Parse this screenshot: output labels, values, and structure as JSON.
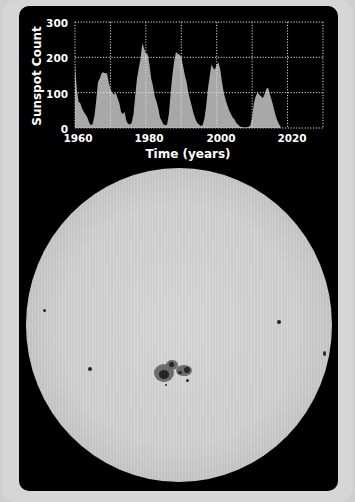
{
  "chart_data": {
    "type": "area",
    "title": "",
    "xlabel": "Time (years)",
    "ylabel": "Sunspot Count",
    "xlim": [
      1960,
      2030
    ],
    "ylim": [
      0,
      300
    ],
    "xticks": [
      1960,
      1980,
      2000,
      2020
    ],
    "yticks": [
      0,
      100,
      200,
      300
    ],
    "grid": true,
    "grid_style": "dotted",
    "series": [
      {
        "name": "Sunspot Count",
        "color": "#a8a8a8",
        "x": [
          1960.0,
          1960.5,
          1961.0,
          1961.5,
          1962.0,
          1962.5,
          1963.0,
          1963.5,
          1964.0,
          1964.5,
          1965.0,
          1965.5,
          1966.0,
          1966.5,
          1967.0,
          1967.5,
          1968.0,
          1968.5,
          1969.0,
          1969.5,
          1970.0,
          1970.5,
          1971.0,
          1971.5,
          1972.0,
          1972.5,
          1973.0,
          1973.5,
          1974.0,
          1974.5,
          1975.0,
          1975.5,
          1976.0,
          1976.5,
          1977.0,
          1977.5,
          1978.0,
          1978.5,
          1979.0,
          1979.5,
          1980.0,
          1980.5,
          1981.0,
          1981.5,
          1982.0,
          1982.5,
          1983.0,
          1983.5,
          1984.0,
          1984.5,
          1985.0,
          1985.5,
          1986.0,
          1986.5,
          1987.0,
          1987.5,
          1988.0,
          1988.5,
          1989.0,
          1989.5,
          1990.0,
          1990.5,
          1991.0,
          1991.5,
          1992.0,
          1992.5,
          1993.0,
          1993.5,
          1994.0,
          1994.5,
          1995.0,
          1995.5,
          1996.0,
          1996.5,
          1997.0,
          1997.5,
          1998.0,
          1998.5,
          1999.0,
          1999.5,
          2000.0,
          2000.5,
          2001.0,
          2001.5,
          2002.0,
          2002.5,
          2003.0,
          2003.5,
          2004.0,
          2004.5,
          2005.0,
          2005.5,
          2006.0,
          2006.5,
          2007.0,
          2007.5,
          2008.0,
          2008.5,
          2009.0,
          2009.5,
          2010.0,
          2010.5,
          2011.0,
          2011.5,
          2012.0,
          2012.5,
          2013.0,
          2013.5,
          2014.0,
          2014.5,
          2015.0,
          2015.5,
          2016.0,
          2016.5,
          2017.0,
          2017.5,
          2018.0
        ],
        "values": [
          180,
          110,
          75,
          70,
          55,
          45,
          38,
          30,
          15,
          8,
          12,
          35,
          80,
          130,
          140,
          155,
          158,
          155,
          155,
          130,
          110,
          100,
          95,
          100,
          85,
          70,
          45,
          40,
          45,
          20,
          12,
          10,
          15,
          40,
          90,
          140,
          170,
          195,
          240,
          225,
          210,
          210,
          180,
          140,
          120,
          90,
          75,
          55,
          30,
          20,
          10,
          8,
          10,
          40,
          100,
          150,
          190,
          215,
          210,
          208,
          200,
          175,
          150,
          130,
          100,
          80,
          60,
          40,
          25,
          15,
          10,
          6,
          8,
          25,
          60,
          110,
          145,
          180,
          170,
          165,
          180,
          185,
          165,
          130,
          100,
          80,
          65,
          50,
          40,
          30,
          25,
          15,
          10,
          5,
          3,
          2,
          1,
          2,
          3,
          8,
          30,
          70,
          90,
          100,
          95,
          90,
          85,
          95,
          110,
          115,
          95,
          80,
          60,
          40,
          25,
          12,
          5
        ]
      }
    ]
  },
  "labels": {
    "y_axis": "Sunspot Count",
    "x_axis": "Time (years)",
    "y_ticks": [
      "300",
      "200",
      "100",
      "0"
    ],
    "x_ticks": [
      "1960",
      "1980",
      "2000",
      "2020"
    ]
  },
  "image": {
    "subject": "Solar disk with sunspots",
    "sun_icon": "sun-disk"
  }
}
